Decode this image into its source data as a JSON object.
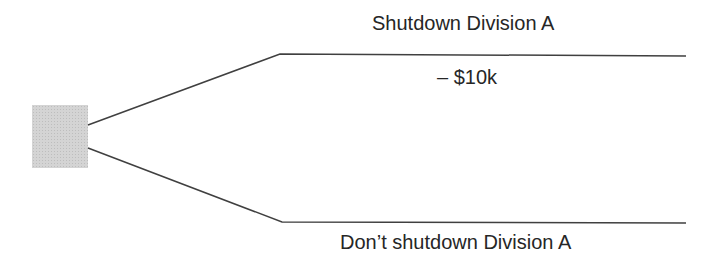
{
  "diagram": {
    "type": "decision-tree",
    "decision_node": {
      "shape": "square",
      "fill": "#d4d4d4"
    },
    "branches": [
      {
        "label": "Shutdown Division A",
        "value": "– $10k"
      },
      {
        "label": "Don’t shutdown Division A",
        "value": ""
      }
    ],
    "line_color": "#404040"
  }
}
